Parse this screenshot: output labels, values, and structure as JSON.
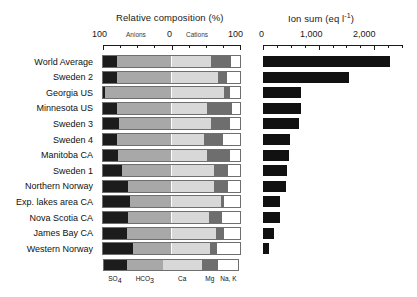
{
  "figure": {
    "left_panel_title": "Relative composition (%)",
    "right_panel_title": "Ion sum (eq l",
    "right_panel_title_sup": "-1",
    "right_panel_title_end": ")",
    "anions_label": "Anions",
    "cations_label": "Cations"
  },
  "axes": {
    "left": {
      "ticks": [
        "100",
        "0",
        "100"
      ],
      "min": -100,
      "max": 100
    },
    "right": {
      "ticks": [
        "0",
        "1,000",
        "2,000"
      ],
      "min": 0,
      "max": 2500
    }
  },
  "legend": {
    "items": [
      {
        "name": "SO4",
        "label_main": "SO",
        "label_sub": "4",
        "color": "#1c1c1c"
      },
      {
        "name": "HCO3",
        "label_main": "HCO",
        "label_sub": "3",
        "color": "#a8a8a8"
      },
      {
        "name": "Ca",
        "label_main": "Ca",
        "label_sub": "",
        "color": "#d8d8d8"
      },
      {
        "name": "Mg",
        "label_main": "Mg",
        "label_sub": "",
        "color": "#6e6e6e"
      },
      {
        "name": "NaK",
        "label_main": "Na, K",
        "label_sub": "",
        "color": "#ffffff"
      }
    ]
  },
  "chart_data": {
    "type": "bar",
    "xlabel": "",
    "ylabel": "",
    "categories": [
      "World Average",
      "Sweden 2",
      "Georgia US",
      "Minnesota US",
      "Sweden 3",
      "Sweden 4",
      "Manitoba CA",
      "Sweden 1",
      "Northern Norway",
      "Exp. lakes area CA",
      "Nova Scotia CA",
      "James Bay CA",
      "Western Norway"
    ],
    "panels": [
      {
        "name": "relative-composition",
        "type": "bar",
        "orientation": "horizontal-stacked-diverging",
        "units": "%",
        "xlim": [
          -100,
          100
        ],
        "xticks": [
          -100,
          0,
          100
        ],
        "xticklabels": [
          "100",
          "0",
          "100"
        ],
        "groups": [
          "Anions",
          "Cations"
        ],
        "series": [
          {
            "name": "SO4",
            "side": "anions",
            "color": "#1c1c1c",
            "values": [
              20,
              21,
              3,
              21,
              23,
              20,
              22,
              28,
              36,
              39,
              37,
              35,
              44
            ]
          },
          {
            "name": "HCO3",
            "side": "anions",
            "color": "#a8a8a8",
            "values": [
              80,
              79,
              97,
              79,
              77,
              80,
              78,
              72,
              64,
              61,
              63,
              65,
              56
            ]
          },
          {
            "name": "Ca",
            "side": "cations",
            "color": "#d8d8d8",
            "values": [
              57,
              68,
              76,
              52,
              57,
              48,
              52,
              62,
              62,
              72,
              55,
              65,
              56
            ]
          },
          {
            "name": "Mg",
            "side": "cations",
            "color": "#6e6e6e",
            "values": [
              30,
              13,
              9,
              37,
              29,
              27,
              33,
              21,
              21,
              4,
              19,
              12,
              10
            ]
          },
          {
            "name": "Na, K",
            "side": "cations",
            "color": "#ffffff",
            "values": [
              13,
              19,
              15,
              11,
              14,
              25,
              15,
              17,
              17,
              24,
              26,
              23,
              34
            ]
          }
        ]
      },
      {
        "name": "ion-sum",
        "type": "bar",
        "orientation": "horizontal",
        "units": "eq l-1",
        "color": "#111111",
        "xlim": [
          0,
          2500
        ],
        "xticks": [
          0,
          1000,
          2000
        ],
        "xticklabels": [
          "0",
          "1,000",
          "2,000"
        ],
        "values": [
          2290,
          1550,
          690,
          680,
          650,
          480,
          470,
          430,
          420,
          310,
          300,
          200,
          100
        ]
      }
    ]
  }
}
